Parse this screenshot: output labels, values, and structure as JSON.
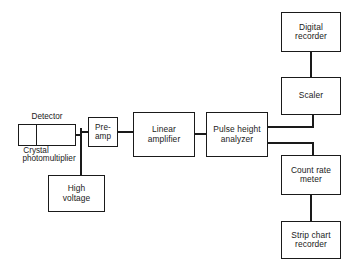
{
  "diagram": {
    "background_color": "#ffffff",
    "line_color": "#1a1a1a",
    "blocks": {
      "detector": {
        "caption": "Detector",
        "left_section_label": "Crystal",
        "right_section_label": "photomultiplier"
      },
      "preamp": {
        "label": "Pre-\namp"
      },
      "linear_amplifier": {
        "label": "Linear\namplifier"
      },
      "pulse_height_analyzer": {
        "label": "Pulse  height\nanalyzer"
      },
      "high_voltage": {
        "label": "High\nvoltage"
      },
      "digital_recorder": {
        "label": "Digital\nrecorder"
      },
      "scaler": {
        "label": "Scaler"
      },
      "count_rate_meter": {
        "label": "Count  rate\nmeter"
      },
      "strip_chart_recorder": {
        "label": "Strip  chart\nrecorder"
      }
    },
    "connections": [
      {
        "name": "detector-to-junction",
        "from": "detector",
        "to": "junction",
        "style": "thin"
      },
      {
        "name": "junction-to-preamp",
        "from": "junction",
        "to": "preamp",
        "style": "thin"
      },
      {
        "name": "junction-to-high-voltage",
        "from": "junction",
        "to": "high_voltage",
        "style": "thick"
      },
      {
        "name": "preamp-to-linear-amplifier",
        "from": "preamp",
        "to": "linear_amplifier",
        "style": "thin"
      },
      {
        "name": "linear-amp-to-analyzer",
        "from": "linear_amplifier",
        "to": "pulse_height_analyzer",
        "style": "thin"
      },
      {
        "name": "analyzer-to-scaler",
        "from": "pulse_height_analyzer",
        "to": "scaler",
        "style": "thick"
      },
      {
        "name": "analyzer-to-count-rate",
        "from": "pulse_height_analyzer",
        "to": "count_rate_meter",
        "style": "thick"
      },
      {
        "name": "scaler-to-digital-recorder",
        "from": "scaler",
        "to": "digital_recorder",
        "style": "thick"
      },
      {
        "name": "count-rate-to-strip-chart",
        "from": "count_rate_meter",
        "to": "strip_chart_recorder",
        "style": "thick"
      }
    ]
  }
}
